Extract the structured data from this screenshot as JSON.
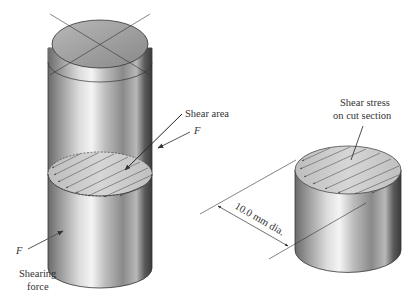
{
  "figure": {
    "left_specimen": {
      "labels": {
        "shear_area": "Shear area",
        "force_top": "F",
        "force_bottom": "F",
        "shearing_force_line1": "Shearing",
        "shearing_force_line2": "force"
      }
    },
    "right_specimen": {
      "labels": {
        "shear_stress_line1": "Shear stress",
        "shear_stress_line2": "on cut section",
        "diameter": "10.0 mm dia."
      }
    },
    "colors": {
      "line": "#333333",
      "metal_dark": "#5a5a5a",
      "metal_light": "#e8e8e8",
      "section": "#c8c8c8"
    }
  }
}
